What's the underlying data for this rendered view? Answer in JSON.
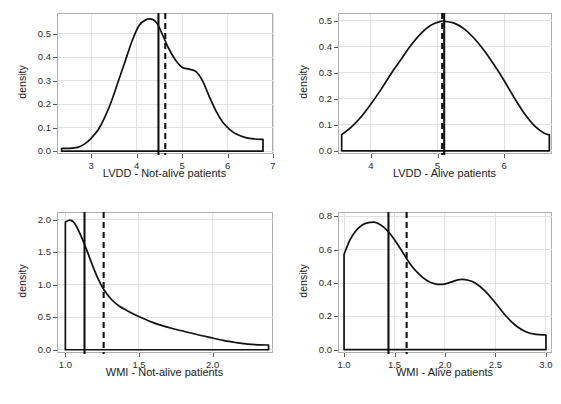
{
  "figure": {
    "background": "#ffffff",
    "line_color": "#111111",
    "grid_color": "#e2e2e2",
    "frame_color": "#aeaeae",
    "panel_count": 4
  },
  "chart_data": [
    {
      "id": "lvdd-not-alive",
      "type": "area",
      "title": "",
      "xlabel": "LVDD - Not-alive patients",
      "ylabel": "density",
      "xlim": [
        2.27,
        7.0
      ],
      "ylim": [
        -0.012,
        0.585
      ],
      "xticks": [
        3,
        4,
        5,
        6,
        7
      ],
      "xtick_labels": [
        "3",
        "4",
        "5",
        "6",
        "7"
      ],
      "yticks": [
        0.0,
        0.1,
        0.2,
        0.3,
        0.4,
        0.5
      ],
      "ytick_labels": [
        "0.0",
        "0.1",
        "0.2",
        "0.3",
        "0.4",
        "0.5"
      ],
      "grid": true,
      "legend": "none",
      "annotations": [
        {
          "kind": "vline",
          "style": "solid",
          "value": 4.48,
          "meaning": "mean"
        },
        {
          "kind": "vline",
          "style": "dashed",
          "value": 4.63,
          "meaning": "median"
        }
      ],
      "x": [
        2.35,
        2.5,
        2.7,
        2.85,
        3.0,
        3.15,
        3.3,
        3.45,
        3.6,
        3.75,
        3.9,
        4.05,
        4.2,
        4.35,
        4.45,
        4.55,
        4.7,
        4.85,
        5.0,
        5.15,
        5.3,
        5.45,
        5.6,
        5.75,
        5.9,
        6.05,
        6.2,
        6.4,
        6.6,
        6.78
      ],
      "y": [
        0.012,
        0.012,
        0.016,
        0.03,
        0.055,
        0.09,
        0.145,
        0.215,
        0.3,
        0.385,
        0.47,
        0.535,
        0.56,
        0.562,
        0.545,
        0.505,
        0.44,
        0.39,
        0.358,
        0.35,
        0.34,
        0.3,
        0.232,
        0.17,
        0.122,
        0.092,
        0.072,
        0.058,
        0.052,
        0.05
      ]
    },
    {
      "id": "lvdd-alive",
      "type": "area",
      "title": "",
      "xlabel": "LVDD - Alive patients",
      "ylabel": "density",
      "xlim": [
        3.52,
        6.72
      ],
      "ylim": [
        -0.012,
        0.525
      ],
      "xticks": [
        4,
        5,
        6
      ],
      "xtick_labels": [
        "4",
        "5",
        "6"
      ],
      "yticks": [
        0.0,
        0.1,
        0.2,
        0.3,
        0.4,
        0.5
      ],
      "ytick_labels": [
        "0.0",
        "0.1",
        "0.2",
        "0.3",
        "0.4",
        "0.5"
      ],
      "grid": true,
      "legend": "none",
      "annotations": [
        {
          "kind": "vline",
          "style": "solid",
          "value": 5.1,
          "meaning": "mean"
        },
        {
          "kind": "vline",
          "style": "dashed",
          "value": 5.07,
          "meaning": "median"
        }
      ],
      "x": [
        3.56,
        3.7,
        3.85,
        4.0,
        4.15,
        4.3,
        4.45,
        4.6,
        4.75,
        4.9,
        5.05,
        5.1,
        5.25,
        5.4,
        5.55,
        5.7,
        5.85,
        6.0,
        6.15,
        6.3,
        6.45,
        6.6,
        6.68
      ],
      "y": [
        0.062,
        0.09,
        0.13,
        0.18,
        0.235,
        0.295,
        0.35,
        0.405,
        0.45,
        0.482,
        0.497,
        0.497,
        0.49,
        0.468,
        0.432,
        0.385,
        0.33,
        0.27,
        0.205,
        0.145,
        0.098,
        0.068,
        0.062
      ]
    },
    {
      "id": "wmi-not-alive",
      "type": "area",
      "title": "",
      "xlabel": "WMI - Not-alive patients",
      "ylabel": "density",
      "xlim": [
        0.95,
        2.41
      ],
      "ylim": [
        -0.05,
        2.1
      ],
      "xticks": [
        1.0,
        1.5,
        2.0
      ],
      "xtick_labels": [
        "1.0",
        "1.5",
        "2.0"
      ],
      "yticks": [
        0.0,
        0.5,
        1.0,
        1.5,
        2.0
      ],
      "ytick_labels": [
        "0.0",
        "0.5",
        "1.0",
        "1.5",
        "2.0"
      ],
      "grid": true,
      "legend": "none",
      "annotations": [
        {
          "kind": "vline",
          "style": "solid",
          "value": 1.13,
          "meaning": "mean"
        },
        {
          "kind": "vline",
          "style": "dashed",
          "value": 1.26,
          "meaning": "median"
        }
      ],
      "x": [
        1.0,
        1.03,
        1.06,
        1.1,
        1.14,
        1.18,
        1.22,
        1.26,
        1.31,
        1.36,
        1.42,
        1.48,
        1.55,
        1.63,
        1.72,
        1.81,
        1.9,
        2.0,
        2.08,
        2.16,
        2.24,
        2.32,
        2.38
      ],
      "y": [
        1.96,
        1.99,
        1.95,
        1.78,
        1.56,
        1.32,
        1.1,
        0.93,
        0.78,
        0.68,
        0.6,
        0.53,
        0.46,
        0.39,
        0.33,
        0.28,
        0.23,
        0.18,
        0.14,
        0.11,
        0.085,
        0.075,
        0.072
      ]
    },
    {
      "id": "wmi-alive",
      "type": "area",
      "title": "",
      "xlabel": "WMI - Alive patients",
      "ylabel": "density",
      "xlim": [
        0.95,
        3.06
      ],
      "ylim": [
        -0.02,
        0.82
      ],
      "xticks": [
        1.0,
        1.5,
        2.0,
        2.5,
        3.0
      ],
      "xtick_labels": [
        "1.0",
        "1.5",
        "2.0",
        "2.5",
        "3.0"
      ],
      "yticks": [
        0.0,
        0.2,
        0.4,
        0.6,
        0.8
      ],
      "ytick_labels": [
        "0.0",
        "0.2",
        "0.4",
        "0.6",
        "0.8"
      ],
      "grid": true,
      "legend": "none",
      "annotations": [
        {
          "kind": "vline",
          "style": "solid",
          "value": 1.44,
          "meaning": "mean"
        },
        {
          "kind": "vline",
          "style": "dashed",
          "value": 1.62,
          "meaning": "median"
        }
      ],
      "x": [
        1.0,
        1.06,
        1.12,
        1.18,
        1.24,
        1.3,
        1.36,
        1.42,
        1.5,
        1.58,
        1.66,
        1.74,
        1.82,
        1.9,
        1.98,
        2.06,
        2.14,
        2.22,
        2.3,
        2.4,
        2.5,
        2.6,
        2.7,
        2.8,
        2.9,
        3.0
      ],
      "y": [
        0.572,
        0.66,
        0.715,
        0.748,
        0.762,
        0.765,
        0.75,
        0.72,
        0.66,
        0.585,
        0.51,
        0.455,
        0.415,
        0.395,
        0.392,
        0.405,
        0.42,
        0.418,
        0.4,
        0.35,
        0.28,
        0.205,
        0.145,
        0.108,
        0.092,
        0.088
      ]
    }
  ]
}
